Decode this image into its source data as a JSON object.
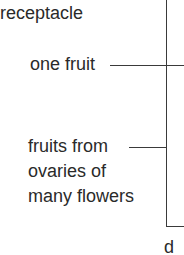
{
  "labels": {
    "receptacle": "receptacle",
    "one_fruit": "one fruit",
    "fruits_line1": "fruits from",
    "fruits_line2": "ovaries of",
    "fruits_line3": "many flowers",
    "panel_letter": "d"
  }
}
